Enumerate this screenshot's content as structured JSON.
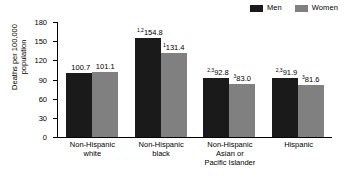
{
  "legend": {
    "items": [
      {
        "label": "Men",
        "color": "#1a1a1a",
        "icon": "legend-swatch-men"
      },
      {
        "label": "Women",
        "color": "#808080",
        "icon": "legend-swatch-women"
      }
    ]
  },
  "axis": {
    "ylabel_line1": "Deaths per 100,000",
    "ylabel_line2": "population",
    "yticks": [
      "180",
      "150",
      "120",
      "90",
      "60",
      "30",
      "0"
    ]
  },
  "chart_data": {
    "type": "bar",
    "title": "",
    "xlabel": "",
    "ylabel": "Deaths per 100,000 population",
    "ylim": [
      0,
      180
    ],
    "ytick_values": [
      0,
      30,
      60,
      90,
      120,
      150,
      180
    ],
    "grid": false,
    "legend_position": "top-right",
    "categories": [
      "Non-Hispanic white",
      "Non-Hispanic black",
      "Non-Hispanic Asian or Pacific Islander",
      "Hispanic"
    ],
    "category_lines": [
      [
        "Non-Hispanic",
        "white"
      ],
      [
        "Non-Hispanic",
        "black"
      ],
      [
        "Non-Hispanic",
        "Asian or",
        "Pacific Islander"
      ],
      [
        "Hispanic"
      ]
    ],
    "series": [
      {
        "name": "Men",
        "color": "#1a1a1a",
        "values": [
          100.7,
          154.8,
          92.8,
          91.9
        ],
        "labels": [
          "100.7",
          "154.8",
          "92.8",
          "91.9"
        ],
        "footnotes": [
          "",
          "1,2",
          "2,3",
          "2,3"
        ]
      },
      {
        "name": "Women",
        "color": "#808080",
        "values": [
          101.1,
          131.4,
          83.0,
          81.6
        ],
        "labels": [
          "101.1",
          "131.4",
          "83.0",
          "81.6"
        ],
        "footnotes": [
          "",
          "1",
          "3",
          "3"
        ]
      }
    ]
  }
}
